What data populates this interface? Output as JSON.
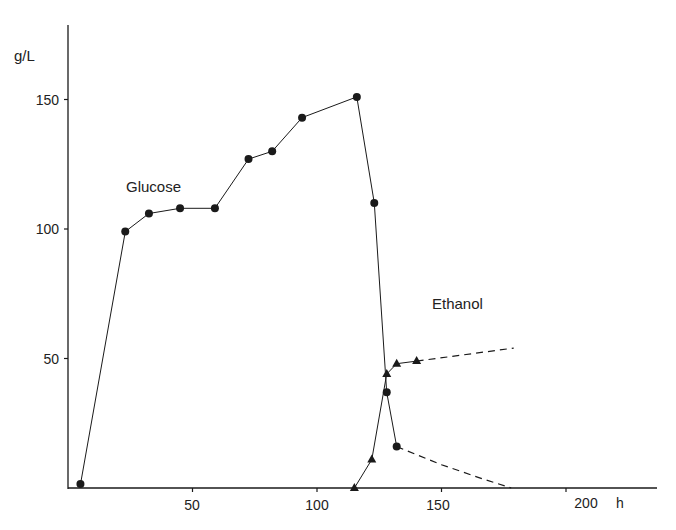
{
  "chart_data": {
    "type": "line",
    "title": "",
    "xlabel": "h",
    "ylabel": "g/L",
    "xlim": [
      0,
      235
    ],
    "ylim": [
      0,
      180
    ],
    "x_ticks": [
      50,
      100,
      150,
      200
    ],
    "y_ticks": [
      50,
      100,
      150
    ],
    "grid": false,
    "legend": "inline labels",
    "series": [
      {
        "name": "Glucose",
        "marker": "circle",
        "line": "solid",
        "x": [
          5,
          23,
          32.5,
          45,
          59,
          72.5,
          82,
          94,
          116,
          123,
          128,
          132
        ],
        "y": [
          1.5,
          99,
          106,
          108,
          108,
          127,
          130,
          143,
          151,
          110,
          37,
          16
        ]
      },
      {
        "name": "Glucose (extrapolated)",
        "marker": "none",
        "line": "dashed",
        "x": [
          132,
          150,
          165,
          178
        ],
        "y": [
          16,
          9,
          4,
          0
        ]
      },
      {
        "name": "Ethanol",
        "marker": "triangle",
        "line": "solid",
        "x": [
          115,
          122,
          128,
          132,
          140
        ],
        "y": [
          0,
          11,
          44,
          48,
          49
        ]
      },
      {
        "name": "Ethanol (extrapolated)",
        "marker": "none",
        "line": "dashed",
        "x": [
          140,
          179
        ],
        "y": [
          49,
          54
        ]
      }
    ],
    "annotations": [
      {
        "text": "Glucose",
        "x": 40,
        "y": 116
      },
      {
        "text": "Ethanol",
        "x": 160,
        "y": 71
      }
    ]
  },
  "labels": {
    "y_unit": "g/L",
    "x_unit": "h",
    "y150": "150",
    "y100": "100",
    "y50": "50",
    "x50": "50",
    "x100": "100",
    "x150": "150",
    "x200": "200",
    "glucose": "Glucose",
    "ethanol": "Ethanol"
  }
}
